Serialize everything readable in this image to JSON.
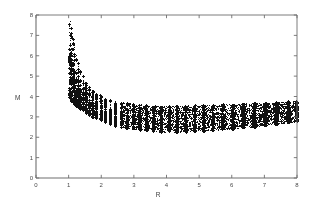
{
  "figure": {
    "background_color": "#ffffff",
    "axis_color": "#6e6e6e",
    "point_color": "#111111",
    "plot_left": 36,
    "plot_top": 15,
    "plot_width": 261,
    "plot_height": 163
  },
  "chart_data": {
    "type": "scatter",
    "title": "",
    "subtitle": "",
    "xlabel": "R",
    "ylabel": "M",
    "xlim": [
      0,
      8
    ],
    "ylim": [
      0,
      8
    ],
    "xticks": [
      0,
      1,
      2,
      3,
      4,
      5,
      6,
      7,
      8
    ],
    "xticklabels": [
      "0",
      "1",
      "2",
      "3",
      "4",
      "5",
      "6",
      "7",
      "8"
    ],
    "yticks": [
      0,
      1,
      2,
      3,
      4,
      5,
      6,
      7,
      8
    ],
    "yticklabels": [
      "0",
      "1",
      "2",
      "3",
      "4",
      "5",
      "6",
      "7",
      "8"
    ],
    "grid": false,
    "legend": null,
    "legend_position": "none",
    "marker": "plus",
    "marker_size": 1.4,
    "marker_color": "#111111",
    "point_count_approx": 9000,
    "columns": [
      {
        "x": 1.0,
        "m_low": 3.95,
        "m_high": 8.0,
        "density": 0.3
      },
      {
        "x": 1.04,
        "m_low": 3.85,
        "m_high": 8.0,
        "density": 0.34
      },
      {
        "x": 1.08,
        "m_low": 3.75,
        "m_high": 7.7,
        "density": 0.36
      },
      {
        "x": 1.12,
        "m_low": 3.68,
        "m_high": 7.2,
        "density": 0.38
      },
      {
        "x": 1.16,
        "m_low": 3.6,
        "m_high": 6.6,
        "density": 0.4
      },
      {
        "x": 1.22,
        "m_low": 3.52,
        "m_high": 6.1,
        "density": 0.42
      },
      {
        "x": 1.28,
        "m_low": 3.44,
        "m_high": 5.7,
        "density": 0.44
      },
      {
        "x": 1.35,
        "m_low": 3.36,
        "m_high": 5.3,
        "density": 0.46
      },
      {
        "x": 1.43,
        "m_low": 3.26,
        "m_high": 5.0,
        "density": 0.5
      },
      {
        "x": 1.52,
        "m_low": 3.16,
        "m_high": 4.72,
        "density": 0.54
      },
      {
        "x": 1.62,
        "m_low": 3.06,
        "m_high": 4.5,
        "density": 0.58
      },
      {
        "x": 1.73,
        "m_low": 2.96,
        "m_high": 4.32,
        "density": 0.62
      },
      {
        "x": 1.85,
        "m_low": 2.88,
        "m_high": 4.18,
        "density": 0.66
      },
      {
        "x": 1.98,
        "m_low": 2.8,
        "m_high": 4.06,
        "density": 0.7
      },
      {
        "x": 2.12,
        "m_low": 2.72,
        "m_high": 3.96,
        "density": 0.74
      },
      {
        "x": 2.27,
        "m_low": 2.64,
        "m_high": 3.88,
        "density": 0.78
      },
      {
        "x": 2.43,
        "m_low": 2.57,
        "m_high": 3.8,
        "density": 0.82
      },
      {
        "x": 2.6,
        "m_low": 2.51,
        "m_high": 3.74,
        "density": 0.85
      },
      {
        "x": 2.78,
        "m_low": 2.45,
        "m_high": 3.69,
        "density": 0.88
      },
      {
        "x": 2.97,
        "m_low": 2.4,
        "m_high": 3.65,
        "density": 0.9
      },
      {
        "x": 3.17,
        "m_low": 2.36,
        "m_high": 3.62,
        "density": 0.92
      },
      {
        "x": 3.38,
        "m_low": 2.32,
        "m_high": 3.59,
        "density": 0.93
      },
      {
        "x": 3.6,
        "m_low": 2.29,
        "m_high": 3.57,
        "density": 0.94
      },
      {
        "x": 3.83,
        "m_low": 2.27,
        "m_high": 3.56,
        "density": 0.95
      },
      {
        "x": 4.07,
        "m_low": 2.26,
        "m_high": 3.55,
        "density": 0.95
      },
      {
        "x": 4.32,
        "m_low": 2.26,
        "m_high": 3.55,
        "density": 0.96
      },
      {
        "x": 4.58,
        "m_low": 2.27,
        "m_high": 3.56,
        "density": 0.96
      },
      {
        "x": 4.85,
        "m_low": 2.29,
        "m_high": 3.57,
        "density": 0.96
      },
      {
        "x": 5.13,
        "m_low": 2.31,
        "m_high": 3.58,
        "density": 0.97
      },
      {
        "x": 5.42,
        "m_low": 2.34,
        "m_high": 3.6,
        "density": 0.97
      },
      {
        "x": 5.72,
        "m_low": 2.38,
        "m_high": 3.62,
        "density": 0.97
      },
      {
        "x": 6.03,
        "m_low": 2.42,
        "m_high": 3.64,
        "density": 0.98
      },
      {
        "x": 6.35,
        "m_low": 2.47,
        "m_high": 3.66,
        "density": 0.98
      },
      {
        "x": 6.68,
        "m_low": 2.52,
        "m_high": 3.68,
        "density": 0.98
      },
      {
        "x": 7.02,
        "m_low": 2.58,
        "m_high": 3.71,
        "density": 0.98
      },
      {
        "x": 7.37,
        "m_low": 2.64,
        "m_high": 3.73,
        "density": 0.99
      },
      {
        "x": 7.73,
        "m_low": 2.71,
        "m_high": 3.76,
        "density": 0.99
      },
      {
        "x": 8.0,
        "m_low": 2.78,
        "m_high": 3.78,
        "density": 0.99
      }
    ]
  }
}
